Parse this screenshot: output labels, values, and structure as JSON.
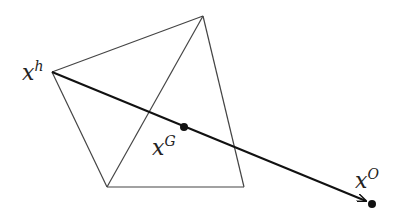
{
  "diagram": {
    "colors": {
      "background": "#ffffff",
      "edge": "#444444",
      "ray": "#111111",
      "point": "#111111"
    },
    "vertices": {
      "xh": [
        52,
        72
      ],
      "top": [
        203,
        16
      ],
      "bottom_left": [
        107,
        187
      ],
      "bottom_right": [
        244,
        187
      ]
    },
    "points": {
      "xG": [
        184,
        127
      ],
      "xO": [
        372,
        204
      ]
    },
    "labels": {
      "xh": {
        "base": "x",
        "sup": "h"
      },
      "xG": {
        "base": "x",
        "sup": "G"
      },
      "xO": {
        "base": "x",
        "sup": "O"
      }
    }
  }
}
